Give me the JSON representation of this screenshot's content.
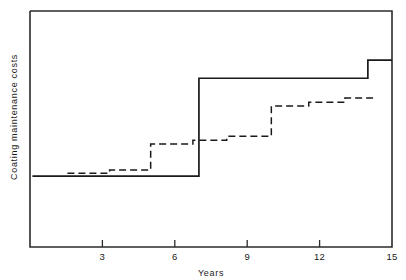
{
  "chart_data": {
    "type": "line",
    "title": "",
    "subtitle": "",
    "xlabel": "Years",
    "ylabel": "Coating maintenance costs",
    "xlim": [
      0,
      15
    ],
    "ylim": [
      0,
      1
    ],
    "xticks": [
      3,
      6,
      9,
      12,
      15
    ],
    "xtick_labels": [
      "3",
      "6",
      "9",
      "12",
      "15"
    ],
    "yticks": [],
    "ytick_labels": [],
    "grid": false,
    "legend": false,
    "legend_position": "none",
    "annotations": [],
    "axis_note": "Vertical axis is unlabelled/qualitative: cumulative cost shown in relative units only.",
    "series": [
      {
        "name": "Solid step curve",
        "style": "solid",
        "drawstyle": "steps-post",
        "color": "#1a1a1a",
        "x": [
          0.1,
          7.0,
          7.0,
          14.0,
          14.0,
          15.0
        ],
        "y": [
          0.3,
          0.3,
          0.715,
          0.715,
          0.792,
          0.792
        ],
        "steps": [
          {
            "year": 0.1,
            "level": 0.3
          },
          {
            "year": 7.0,
            "level": 0.715
          },
          {
            "year": 14.0,
            "level": 0.792
          }
        ]
      },
      {
        "name": "Dashed step curve",
        "style": "dashed",
        "drawstyle": "steps-post",
        "color": "#1a1a1a",
        "x": [
          1.55,
          3.3,
          3.3,
          5.0,
          5.0,
          6.75,
          6.75,
          8.15,
          8.15,
          10.0,
          10.0,
          11.55,
          11.55,
          13.05,
          13.05,
          14.3
        ],
        "y": [
          0.312,
          0.312,
          0.326,
          0.326,
          0.436,
          0.436,
          0.452,
          0.452,
          0.469,
          0.469,
          0.597,
          0.597,
          0.613,
          0.613,
          0.631,
          0.631
        ],
        "steps": [
          {
            "year": 1.55,
            "level": 0.312
          },
          {
            "year": 3.3,
            "level": 0.326
          },
          {
            "year": 5.0,
            "level": 0.436
          },
          {
            "year": 6.75,
            "level": 0.452
          },
          {
            "year": 8.15,
            "level": 0.469
          },
          {
            "year": 10.0,
            "level": 0.597
          },
          {
            "year": 11.55,
            "level": 0.613
          },
          {
            "year": 13.05,
            "level": 0.631
          }
        ]
      }
    ]
  },
  "axes": {
    "x_title": "Years",
    "y_title": "Coating maintenance costs",
    "tick_0": "3",
    "tick_1": "6",
    "tick_2": "9",
    "tick_3": "12",
    "tick_4": "15"
  },
  "colors": {
    "line": "#1a1a1a",
    "frame": "#2b2b2b",
    "background": "#ffffff"
  }
}
